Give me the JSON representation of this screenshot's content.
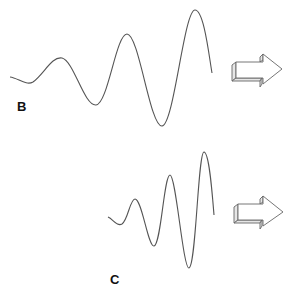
{
  "panels": [
    {
      "id": "B",
      "label": "B",
      "description": "Wave with gradually increasing amplitude, longer wavelength",
      "direction": "right"
    },
    {
      "id": "C",
      "label": "C",
      "description": "Wave with rapidly increasing amplitude, shorter wavelength",
      "direction": "right"
    }
  ],
  "colors": {
    "wave": "#555555",
    "arrow_stroke": "#666666",
    "arrow_fill": "#ffffff",
    "arrow_side": "#e6e6e6",
    "label": "#111111"
  }
}
